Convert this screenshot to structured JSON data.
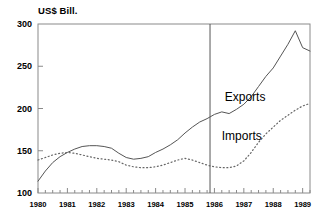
{
  "chart_data": {
    "type": "line",
    "title": "",
    "subtitle": "",
    "ylabel": "US$ Bill.",
    "xlabel": "",
    "ylim": [
      100,
      300
    ],
    "yticks": [
      100,
      150,
      200,
      250,
      300
    ],
    "ytick_labels": [
      "100",
      "150",
      "200",
      "250",
      "300"
    ],
    "xlim": [
      1980.0,
      1989.25
    ],
    "xticks": [
      1980,
      1981,
      1982,
      1983,
      1984,
      1985,
      1986,
      1987,
      1988,
      1989
    ],
    "xtick_labels": [
      "1980",
      "1981",
      "1982",
      "1983",
      "1984",
      "1985",
      "1986",
      "1987",
      "1988",
      "1989"
    ],
    "minor_tick_interval": 0.25,
    "grid": false,
    "legend_position": "inline-annotation",
    "annotations": [
      {
        "text": "Exports",
        "x": 1986.35,
        "y": 212
      },
      {
        "text": "Imports",
        "x": 1986.25,
        "y": 166
      }
    ],
    "reference_lines": [
      {
        "orientation": "vertical",
        "x": 1985.85,
        "label": ""
      }
    ],
    "series": [
      {
        "name": "Exports",
        "style": "solid",
        "color": "#555555",
        "x": [
          1980.0,
          1980.25,
          1980.5,
          1980.75,
          1981.0,
          1981.25,
          1981.5,
          1981.75,
          1982.0,
          1982.25,
          1982.5,
          1982.75,
          1983.0,
          1983.25,
          1983.5,
          1983.75,
          1984.0,
          1984.25,
          1984.5,
          1984.75,
          1985.0,
          1985.25,
          1985.5,
          1985.75,
          1986.0,
          1986.25,
          1986.5,
          1986.75,
          1987.0,
          1987.25,
          1987.5,
          1987.75,
          1988.0,
          1988.25,
          1988.5,
          1988.75,
          1989.0,
          1989.25
        ],
        "values": [
          114,
          126,
          136,
          143,
          148,
          152,
          155,
          156,
          156,
          155,
          153,
          147,
          142,
          140,
          141,
          143,
          148,
          152,
          157,
          163,
          171,
          178,
          184,
          188,
          193,
          196,
          194,
          199,
          205,
          214,
          226,
          238,
          248,
          262,
          276,
          292,
          272,
          268
        ]
      },
      {
        "name": "Imports",
        "style": "dotted",
        "color": "#666666",
        "x": [
          1980.0,
          1980.25,
          1980.5,
          1980.75,
          1981.0,
          1981.25,
          1981.5,
          1981.75,
          1982.0,
          1982.25,
          1982.5,
          1982.75,
          1983.0,
          1983.25,
          1983.5,
          1983.75,
          1984.0,
          1984.25,
          1984.5,
          1984.75,
          1985.0,
          1985.25,
          1985.5,
          1985.75,
          1986.0,
          1986.25,
          1986.5,
          1986.75,
          1987.0,
          1987.25,
          1987.5,
          1987.75,
          1988.0,
          1988.25,
          1988.5,
          1988.75,
          1989.0,
          1989.25
        ],
        "values": [
          139,
          142,
          145,
          147,
          148,
          147,
          145,
          143,
          141,
          140,
          139,
          137,
          133,
          131,
          130,
          130,
          131,
          133,
          136,
          139,
          141,
          139,
          136,
          133,
          131,
          130,
          130,
          132,
          138,
          148,
          160,
          170,
          178,
          186,
          192,
          198,
          203,
          206
        ]
      }
    ]
  }
}
